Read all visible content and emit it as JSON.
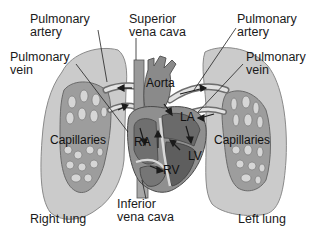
{
  "labels": {
    "pulmonary_artery_left": [
      "Pulmonary",
      "artery"
    ],
    "pulmonary_vein_left": [
      "Pulmonary",
      "vein"
    ],
    "superior_vena_cava": [
      "Superior",
      "vena cava"
    ],
    "pulmonary_artery_right": [
      "Pulmonary",
      "artery"
    ],
    "pulmonary_vein_right": [
      "Pulmonary",
      "vein"
    ],
    "aorta": "Aorta",
    "la": "LA",
    "ra": "RA",
    "lv": "LV",
    "rv": "RV",
    "capillaries_left": "Capillaries",
    "capillaries_right": "Capillaries",
    "inferior_vena_cava": [
      "Inferior",
      "vena cava"
    ],
    "right_lung": "Right lung",
    "left_lung": "Left lung"
  },
  "colors": {
    "lung_fill": "#c9c9c9",
    "lung_stroke": "#8a8a8a",
    "capillary_bed": "#9a9a9a",
    "capillary_holes": "#d8d8d8",
    "heart_fill": "#8f8f8f",
    "heart_dark": "#5e5e5e",
    "vessel_light": "#e6e6e6",
    "leader_line": "#222222"
  }
}
